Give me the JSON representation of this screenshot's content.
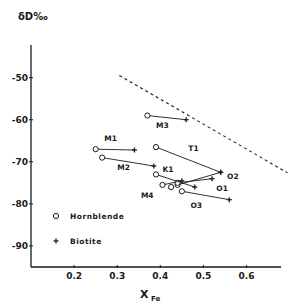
{
  "chart_data": {
    "type": "scatter",
    "title": "",
    "ylabel": "δD‰",
    "xlabel": "X",
    "xlabel_sub": "Fe",
    "xlim": [
      0.1,
      0.68
    ],
    "ylim": [
      -95,
      -42
    ],
    "xticks": [
      0.2,
      0.3,
      0.4,
      0.5,
      0.6
    ],
    "xtick_labels": [
      "0.2",
      "0.3",
      "0.4",
      "0.5",
      "0.6"
    ],
    "yticks": [
      -50,
      -60,
      -70,
      -80,
      -90
    ],
    "ytick_labels": [
      "-50",
      "-60",
      "-70",
      "-80",
      "-90"
    ],
    "grid": false,
    "legend": {
      "placement": "bottom-left",
      "entries": [
        {
          "marker": "open-circle",
          "label": "Hornblende"
        },
        {
          "marker": "plus",
          "label": "Biotite"
        }
      ]
    },
    "pairs": [
      {
        "label": "M3",
        "hornblende": [
          0.37,
          -59
        ],
        "biotite": [
          0.46,
          -60
        ],
        "label_pos": [
          0.39,
          -62
        ]
      },
      {
        "label": "M1",
        "hornblende": [
          0.25,
          -67
        ],
        "biotite": [
          0.34,
          -67.2
        ],
        "label_pos": [
          0.27,
          -65
        ]
      },
      {
        "label": "M2",
        "hornblende": [
          0.265,
          -69
        ],
        "biotite": [
          0.385,
          -71
        ],
        "label_pos": [
          0.3,
          -72
        ]
      },
      {
        "label": "T1",
        "hornblende": [
          0.39,
          -66.5
        ],
        "biotite": [
          0.54,
          -72.5
        ],
        "label_pos": [
          0.465,
          -67.5
        ]
      },
      {
        "label": "K1",
        "hornblende": [
          0.39,
          -73
        ],
        "biotite": [
          0.48,
          -76
        ],
        "label_pos": [
          0.405,
          -72.5
        ]
      },
      {
        "label": "O2",
        "hornblende": [
          0.44,
          -75.5
        ],
        "biotite": [
          0.54,
          -72.5
        ],
        "label_pos": [
          0.555,
          -74
        ]
      },
      {
        "label": "O1",
        "hornblende": [
          0.44,
          -75
        ],
        "biotite": [
          0.52,
          -74
        ],
        "label_pos": [
          0.53,
          -77
        ]
      },
      {
        "label": "M4",
        "hornblende": [
          0.405,
          -75.5
        ],
        "biotite": [
          0.45,
          -74.5
        ],
        "label_pos": [
          0.355,
          -78.5
        ]
      },
      {
        "label": "",
        "hornblende": [
          0.425,
          -76
        ],
        "biotite": [
          0.425,
          -76
        ],
        "label_pos": null
      },
      {
        "label": "O3",
        "hornblende": [
          0.45,
          -77
        ],
        "biotite": [
          0.56,
          -79
        ],
        "label_pos": [
          0.47,
          -81
        ]
      }
    ],
    "reference_line": {
      "style": "dashed",
      "points": [
        [
          0.305,
          -49.5
        ],
        [
          0.695,
          -72.6
        ]
      ]
    }
  }
}
